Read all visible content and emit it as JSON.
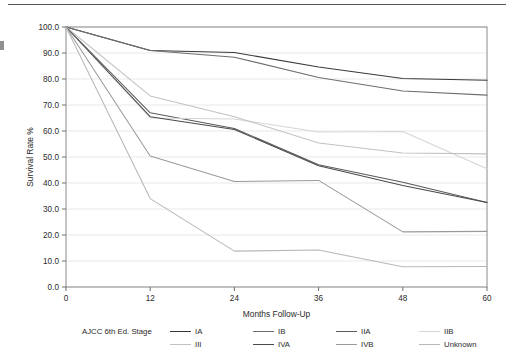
{
  "figure": {
    "top_rule": true,
    "background": "#ffffff"
  },
  "chart_data": {
    "type": "line",
    "title": "",
    "subtitle": "",
    "xlabel": "Months Follow-Up",
    "ylabel": "Survival Rate %",
    "x": [
      0,
      12,
      24,
      36,
      48,
      60
    ],
    "xtick_labels": [
      "0",
      "12",
      "24",
      "36",
      "48",
      "60"
    ],
    "xlim": [
      0,
      60
    ],
    "ylim": [
      0,
      100
    ],
    "ytick_labels": [
      "0.0",
      "10.0",
      "20.0",
      "30.0",
      "40.0",
      "50.0",
      "60.0",
      "70.0",
      "80.0",
      "90.0",
      "100.0"
    ],
    "yticks": [
      0,
      10,
      20,
      30,
      40,
      50,
      60,
      70,
      80,
      90,
      100
    ],
    "grid": "horizontal",
    "legend_position": "below",
    "legend_title": "AJCC 6th Ed. Stage",
    "series": [
      {
        "name": "IA",
        "color": "#3a3a3a",
        "values": [
          100.0,
          91.0,
          90.2,
          84.6,
          80.2,
          79.5
        ]
      },
      {
        "name": "IB",
        "color": "#6e6e6e",
        "values": [
          100.0,
          91.0,
          88.4,
          80.6,
          75.4,
          73.8
        ]
      },
      {
        "name": "IIA",
        "color": "#5a5a5a",
        "values": [
          100.0,
          67.0,
          61.0,
          47.0,
          40.3,
          32.5
        ]
      },
      {
        "name": "IIB",
        "color": "#d6d6d6",
        "values": [
          100.0,
          65.0,
          64.6,
          59.6,
          59.8,
          45.5
        ]
      },
      {
        "name": "III",
        "color": "#c2c2c2",
        "values": [
          100.0,
          73.5,
          65.5,
          55.4,
          51.5,
          51.2
        ]
      },
      {
        "name": "IVA",
        "color": "#4a4a4a",
        "values": [
          100.0,
          65.5,
          60.6,
          46.6,
          39.0,
          32.5
        ]
      },
      {
        "name": "IVB",
        "color": "#9a9a9a",
        "values": [
          100.0,
          50.4,
          40.6,
          41.0,
          21.2,
          21.4
        ]
      },
      {
        "name": "Unknown",
        "color": "#b8b8b8",
        "values": [
          100.0,
          34.0,
          13.8,
          14.2,
          7.8,
          7.9
        ]
      }
    ]
  },
  "legend": {
    "title": "AJCC 6th Ed. Stage",
    "items": [
      {
        "label": "IA",
        "color": "#3a3a3a"
      },
      {
        "label": "IB",
        "color": "#6e6e6e"
      },
      {
        "label": "IIA",
        "color": "#5a5a5a"
      },
      {
        "label": "IIB",
        "color": "#d6d6d6"
      },
      {
        "label": "III",
        "color": "#c2c2c2"
      },
      {
        "label": "IVA",
        "color": "#4a4a4a"
      },
      {
        "label": "IVB",
        "color": "#9a9a9a"
      },
      {
        "label": "Unknown",
        "color": "#b8b8b8"
      }
    ]
  }
}
